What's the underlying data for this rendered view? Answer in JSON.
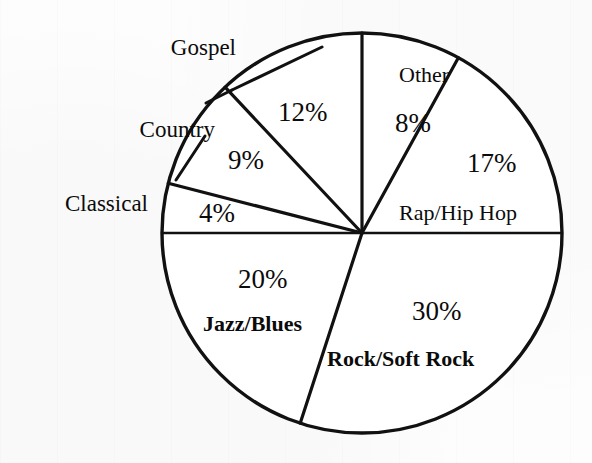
{
  "figure": {
    "background_color": "#fdfdfd",
    "ink_color": "#111111",
    "width": 592,
    "height": 463
  },
  "chart_data": {
    "type": "pie",
    "title": "",
    "subtitle": "",
    "xlabel": "",
    "ylabel": "",
    "legend_position": "none",
    "grid": false,
    "units": "percent",
    "total": 100,
    "start_angle_deg": 0,
    "direction": "clockwise",
    "center": [
      362,
      233
    ],
    "radius": 200,
    "categories": [
      "Other",
      "Rap/Hip Hop",
      "Rock/Soft Rock",
      "Jazz/Blues",
      "Classical",
      "Country",
      "Gospel"
    ],
    "values": [
      8,
      17,
      30,
      20,
      4,
      9,
      12
    ],
    "slices": [
      {
        "name": "Other",
        "value": 8,
        "percent_label": "8%",
        "label_placement": "inside",
        "start_deg": 0,
        "end_deg": 28.8
      },
      {
        "name": "Rap/Hip Hop",
        "value": 17,
        "percent_label": "17%",
        "label_placement": "inside",
        "start_deg": 28.8,
        "end_deg": 90.0
      },
      {
        "name": "Rock/Soft Rock",
        "value": 30,
        "percent_label": "30%",
        "label_placement": "inside",
        "start_deg": 90.0,
        "end_deg": 198.0
      },
      {
        "name": "Jazz/Blues",
        "value": 20,
        "percent_label": "20%",
        "label_placement": "inside",
        "start_deg": 198.0,
        "end_deg": 270.0
      },
      {
        "name": "Classical",
        "value": 4,
        "percent_label": "4%",
        "label_placement": "outside-left",
        "start_deg": 270.0,
        "end_deg": 284.4
      },
      {
        "name": "Country",
        "value": 9,
        "percent_label": "9%",
        "label_placement": "outside-left",
        "start_deg": 284.4,
        "end_deg": 316.8
      },
      {
        "name": "Gospel",
        "value": 12,
        "percent_label": "12%",
        "label_placement": "outside-top",
        "start_deg": 316.8,
        "end_deg": 360.0
      }
    ]
  },
  "labels": {
    "other_name": "Other",
    "other_pct": "8%",
    "rap_pct": "17%",
    "rap_name": "Rap/Hip Hop",
    "rock_pct": "30%",
    "rock_name": "Rock/Soft Rock",
    "jazz_pct": "20%",
    "jazz_name": "Jazz/Blues",
    "classical_name": "Classical",
    "classical_pct": "4%",
    "country_name": "Country",
    "country_pct": "9%",
    "gospel_name": "Gospel",
    "gospel_pct": "12%"
  }
}
